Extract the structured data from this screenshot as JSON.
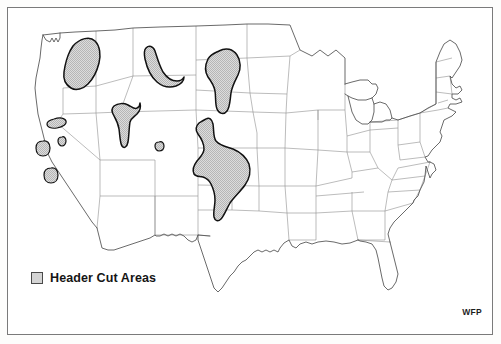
{
  "map": {
    "title": "United States Header Cut Areas Map",
    "credit": "WFP",
    "legend": {
      "swatch_name": "shaded-area-swatch",
      "label": "Header Cut Areas",
      "swatch_fill": "#d4d4d4",
      "swatch_stroke": "#4a4a4a"
    },
    "colors": {
      "page_background": "#ffffff",
      "frame_stroke": "#7a7a7a",
      "state_border": "#8c8c8c",
      "country_outline": "#555555",
      "region_fill": "#d4d4d4",
      "region_stroke": "#111111",
      "text": "#151515"
    },
    "regions": [
      {
        "name": "palouse-washington-oregon-idaho",
        "label": "Palouse / Columbia Plateau",
        "states": [
          "Washington",
          "Oregon",
          "Idaho"
        ],
        "path": "M 73 46 C 80 38 90 36 95 41 C 100 46 101 55 99 63 C 97 71 93 79 88 84 C 83 89 76 91 71 88 C 66 85 63 79 64 72 C 65 65 67 57 70 51 Z"
      },
      {
        "name": "north-central-montana",
        "label": "North Central Montana",
        "states": [
          "Montana"
        ],
        "path": "M 146 48 C 149 45 153 46 155 51 C 157 57 159 65 163 72 C 167 78 172 81 177 81 C 181 81 183 79 184 77 C 184 81 181 84 176 86 C 170 88 163 87 157 82 C 151 77 147 68 145 59 C 144 54 144 50 146 48 Z"
      },
      {
        "name": "dakotas-north-south",
        "label": "Dakotas",
        "states": [
          "North Dakota",
          "South Dakota"
        ],
        "path": "M 219 51 C 226 47 233 49 237 55 C 241 61 241 69 238 75 C 235 81 232 86 231 93 C 230 100 230 107 227 111 C 224 115 219 114 217 109 C 215 104 216 97 215 91 C 214 85 211 81 208 77 C 205 72 205 65 208 59 C 211 54 215 53 219 51 Z"
      },
      {
        "name": "southeast-idaho-northern-utah",
        "label": "Southeast Idaho / Northern Utah",
        "states": [
          "Idaho",
          "Utah"
        ],
        "path": "M 114 106 C 118 103 124 103 128 105 C 132 107 135 110 137 108 C 139 107 140 105 140 103 C 141 107 140 111 137 114 C 134 117 131 118 130 122 C 129 128 129 136 128 142 C 127 147 124 149 122 146 C 120 143 120 136 119 129 C 118 122 115 118 113 114 C 111 110 112 108 114 106 Z"
      },
      {
        "name": "central-plains-colorado-kansas-oklahoma",
        "label": "Central Plains (Eastern Colorado, Western Kansas, Oklahoma Panhandle)",
        "states": [
          "Colorado",
          "Kansas",
          "Oklahoma",
          "Nebraska"
        ],
        "path": "M 206 119 C 209 117 212 119 213 124 C 214 130 213 137 216 141 C 220 146 227 147 233 149 C 240 152 246 157 249 164 C 251 171 250 178 245 185 C 240 192 234 197 230 203 C 226 210 224 216 221 219 C 218 222 215 221 214 217 C 213 212 215 206 215 200 C 215 193 213 188 211 184 C 209 180 206 178 203 177 C 199 176 196 177 194 174 C 192 170 194 165 197 161 C 200 157 204 154 204 149 C 204 143 201 138 198 134 C 195 130 196 126 199 123 C 202 121 204 120 206 119 Z"
      },
      {
        "name": "northwest-colorado-oval",
        "label": "Northwest Colorado",
        "states": [
          "Colorado"
        ],
        "path": "M 159 142 C 162 141 164 143 164 146 C 164 149 162 151 159 151 C 157 151 155 149 155 146 C 155 143 157 142 159 142 Z"
      },
      {
        "name": "southern-oregon-oval",
        "label": "Southern Oregon",
        "states": [
          "Oregon"
        ],
        "path": "M 54 119 C 60 117 65 118 66 121 C 67 124 63 127 57 128 C 51 129 47 127 47 124 C 47 121 50 120 54 119 Z"
      },
      {
        "name": "northeast-california-oval",
        "label": "Northeast California",
        "states": [
          "California"
        ],
        "path": "M 43 141 C 47 140 50 143 50 148 C 50 153 47 156 43 156 C 39 156 36 153 36 148 C 36 143 39 141 43 141 Z"
      },
      {
        "name": "sierra-valley-oval",
        "label": "Sierra Valley California",
        "states": [
          "California"
        ],
        "path": "M 62 137 C 64 136 66 138 66 141 C 66 144 64 146 62 146 C 60 146 58 144 58 141 C 58 138 60 137 62 137 Z"
      },
      {
        "name": "central-california-oval",
        "label": "Central California",
        "states": [
          "California"
        ],
        "path": "M 51 168 C 55 167 58 170 58 175 C 58 180 55 183 51 183 C 47 183 44 180 44 175 C 44 170 47 168 51 168 Z"
      }
    ]
  }
}
